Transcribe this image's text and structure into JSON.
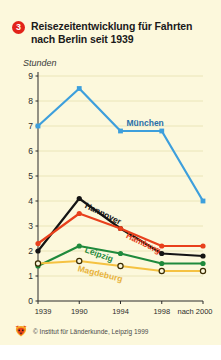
{
  "figure": {
    "badge": "3",
    "title": "Reisezeitentwicklung für Fahrten nach Berlin seit 1939",
    "background_color": "#fcf8dc",
    "badge_color": "#e2231a"
  },
  "footer": {
    "credit": "© Institut für Länderkunde, Leipzig 1999",
    "logo_icon": "fox-logo-icon"
  },
  "chart_data": {
    "type": "line",
    "title": "Reisezeitentwicklung für Fahrten nach Berlin seit 1939",
    "xlabel": "",
    "ylabel": "Stunden",
    "categories": [
      "1939",
      "1990",
      "1994",
      "1998",
      "nach 2000"
    ],
    "ylim": [
      0,
      9
    ],
    "yticks": [
      0,
      1,
      2,
      3,
      4,
      5,
      6,
      7,
      8,
      9
    ],
    "ytick_labels": [
      "0",
      "1",
      "2",
      "3",
      "4",
      "5",
      "6",
      "7",
      "8",
      "9"
    ],
    "grid": true,
    "legend": "inline-labels",
    "series": [
      {
        "name": "München",
        "color": "#3d9fdc",
        "marker": "filled-square",
        "values": [
          7.0,
          8.5,
          6.8,
          6.8,
          4.0
        ],
        "label_x": "1994",
        "label_position": "above-right"
      },
      {
        "name": "Hannover",
        "color": "#141414",
        "marker": "filled-circle",
        "values": [
          2.0,
          4.1,
          2.9,
          1.9,
          1.8
        ],
        "label_x": "1990",
        "label_position": "right-rotated"
      },
      {
        "name": "Hamburg",
        "color": "#e8401c",
        "marker": "filled-circle",
        "values": [
          2.3,
          3.5,
          2.9,
          2.2,
          2.2
        ],
        "label_x": "1994",
        "label_position": "right-rotated"
      },
      {
        "name": "Leipzig",
        "color": "#1f8a3c",
        "marker": "filled-circle",
        "values": [
          1.4,
          2.2,
          1.9,
          1.5,
          1.5
        ],
        "label_x": "1990",
        "label_position": "right-rotated"
      },
      {
        "name": "Magdeburg",
        "color": "#f5c242",
        "marker": "open-circle",
        "values": [
          1.5,
          1.6,
          1.4,
          1.2,
          1.2
        ],
        "label_x": "1990",
        "label_position": "right-rotated"
      }
    ]
  }
}
